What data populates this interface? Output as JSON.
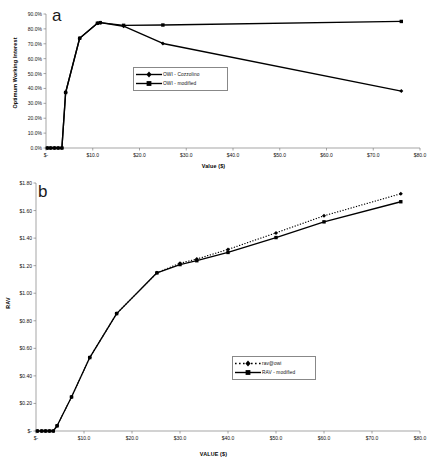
{
  "figure": {
    "panels": [
      {
        "letter": "a",
        "title": "",
        "y_axis_title": "Optimum Working Interest",
        "x_axis_title": "Value ($)"
      },
      {
        "letter": "b",
        "title": "",
        "y_axis_title": "RAV",
        "x_axis_title": "VALUE ($)"
      }
    ]
  },
  "colors": {
    "line": "#000000",
    "axis": "#808080",
    "text": "#111111",
    "background": "#ffffff",
    "legend_border": "#888888"
  },
  "chart_data": [
    {
      "type": "line",
      "panel": "a",
      "title": "",
      "xlabel": "Value ($)",
      "ylabel": "Optimum Working Interest",
      "xlim": [
        0,
        80
      ],
      "ylim": [
        0,
        0.9
      ],
      "grid": false,
      "legend_position": "center-left",
      "xticks": [
        0,
        10,
        20,
        30,
        40,
        50,
        60,
        70,
        80
      ],
      "xtick_labels": [
        "$-",
        "$10.0",
        "$20.0",
        "$30.0",
        "$40.0",
        "$50.0",
        "$60.0",
        "$70.0",
        "$80.0"
      ],
      "yticks": [
        0,
        0.1,
        0.2,
        0.3,
        0.4,
        0.5,
        0.6,
        0.7,
        0.8,
        0.9
      ],
      "ytick_labels": [
        "0.0%",
        "10.0%",
        "20.0%",
        "30.0%",
        "40.0%",
        "50.0%",
        "60.0%",
        "70.0%",
        "80.0%",
        "90.0%"
      ],
      "series": [
        {
          "name": "OWI - Cozzolino",
          "marker": "diamond",
          "linestyle": "solid",
          "x": [
            0.3,
            1.0,
            1.8,
            2.6,
            3.4,
            4.2,
            7.2,
            11.0,
            11.6,
            16.6,
            25.0,
            76.0
          ],
          "values": [
            0.0,
            0.0,
            0.0,
            0.0,
            0.0,
            0.373,
            0.737,
            0.838,
            0.842,
            0.818,
            0.702,
            0.382
          ]
        },
        {
          "name": "OWI - modified",
          "marker": "square",
          "linestyle": "solid",
          "x": [
            0.3,
            1.0,
            1.8,
            2.6,
            3.4,
            4.2,
            7.2,
            11.0,
            11.6,
            16.6,
            25.0,
            76.0
          ],
          "values": [
            0.0,
            0.0,
            0.0,
            0.0,
            0.0,
            0.373,
            0.737,
            0.838,
            0.842,
            0.824,
            0.826,
            0.85
          ]
        }
      ],
      "legend": [
        {
          "label": "OWI - Cozzolino",
          "marker": "diamond",
          "linestyle": "solid"
        },
        {
          "label": "OWI - modified",
          "marker": "square",
          "linestyle": "solid"
        }
      ]
    },
    {
      "type": "line",
      "panel": "b",
      "title": "",
      "xlabel": "VALUE ($)",
      "ylabel": "RAV",
      "xlim": [
        0,
        80
      ],
      "ylim": [
        0,
        1.8
      ],
      "grid": false,
      "legend_position": "center-right",
      "xticks": [
        0,
        10,
        20,
        30,
        40,
        50,
        60,
        70,
        80
      ],
      "xtick_labels": [
        "$-",
        "$10.0",
        "$20.0",
        "$30.0",
        "$40.0",
        "$50.0",
        "$60.0",
        "$70.0",
        "$80.0"
      ],
      "yticks": [
        0,
        0.2,
        0.4,
        0.6,
        0.8,
        1.0,
        1.2,
        1.4,
        1.6,
        1.8
      ],
      "ytick_labels": [
        "$-",
        "$0.20",
        "$0.40",
        "$0.60",
        "$0.80",
        "$1.00",
        "$1.20",
        "$1.40",
        "$1.60",
        "$1.80"
      ],
      "series": [
        {
          "name": "rav@owi",
          "marker": "diamond",
          "linestyle": "dotted",
          "x": [
            0.3,
            1.2,
            2.0,
            2.8,
            3.6,
            4.4,
            7.4,
            11.2,
            16.8,
            25.2,
            30.0,
            33.5,
            40.0,
            50.0,
            60.0,
            76.0
          ],
          "values": [
            0.0,
            0.0,
            0.0,
            0.0,
            0.0,
            0.038,
            0.247,
            0.533,
            0.852,
            1.148,
            1.218,
            1.248,
            1.318,
            1.438,
            1.562,
            1.722
          ]
        },
        {
          "name": "RAV - modified",
          "marker": "square",
          "linestyle": "solid",
          "x": [
            0.3,
            1.2,
            2.0,
            2.8,
            3.6,
            4.4,
            7.4,
            11.2,
            16.8,
            25.2,
            30.0,
            33.5,
            40.0,
            50.0,
            60.0,
            76.0
          ],
          "values": [
            0.0,
            0.0,
            0.0,
            0.0,
            0.0,
            0.038,
            0.247,
            0.533,
            0.852,
            1.148,
            1.208,
            1.236,
            1.296,
            1.404,
            1.518,
            1.664
          ]
        }
      ],
      "legend": [
        {
          "label": "rav@owi",
          "marker": "diamond",
          "linestyle": "dotted"
        },
        {
          "label": "RAV - modified",
          "marker": "square",
          "linestyle": "solid"
        }
      ]
    }
  ]
}
